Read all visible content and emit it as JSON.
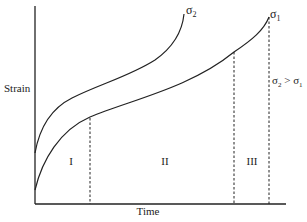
{
  "diagram": {
    "axes": {
      "y_label": "Strain",
      "x_label": "Time"
    },
    "curves": [
      {
        "name": "sigma2",
        "label_base": "σ",
        "label_sub": "2"
      },
      {
        "name": "sigma1",
        "label_base": "σ",
        "label_sub": "1"
      }
    ],
    "stages": [
      {
        "id": "primary",
        "label": "I"
      },
      {
        "id": "secondary",
        "label": "II"
      },
      {
        "id": "tertiary",
        "label": "III"
      }
    ],
    "annotation": {
      "left_base": "σ",
      "left_sub": "2",
      "op": " > ",
      "right_base": "σ",
      "right_sub": "1"
    },
    "colors": {
      "line": "#222222",
      "background": "#ffffff"
    }
  }
}
